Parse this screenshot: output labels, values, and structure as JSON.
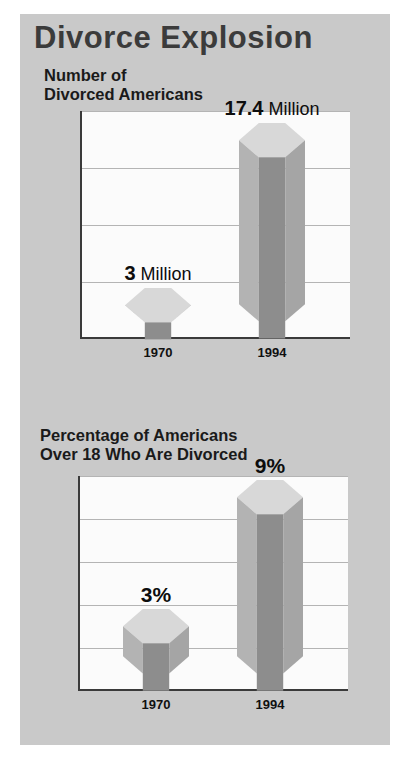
{
  "poster": {
    "title": "Divorce Explosion",
    "background_color": "#c9c9c9",
    "title_color": "#3b3b3b"
  },
  "chart_data": [
    {
      "type": "bar",
      "title": "Number of\nDivorced Americans",
      "title_line1": "Number of",
      "title_line2": "Divorced Americans",
      "categories": [
        "1970",
        "1994"
      ],
      "values": [
        3,
        17.4
      ],
      "value_labels": [
        "3",
        "17.4"
      ],
      "value_units": [
        "Million",
        "Million"
      ],
      "xlabel": "",
      "ylabel": "",
      "ylim": [
        0,
        20
      ],
      "yticks": [
        "0",
        "5",
        "10",
        "15",
        "20"
      ],
      "ytick_values": [
        0,
        5,
        10,
        15,
        20
      ],
      "grid": true,
      "legend": "none",
      "bar_style": "3d-hexagonal-prism",
      "colors": {
        "top_face": "#d8d8d8",
        "left_face": "#b3b3b3",
        "center_face": "#8d8d8d",
        "right_face": "#a5a5a5",
        "plot_background": "#fbfbfb",
        "gridline": "#b4b4b4",
        "axis": "#3a3a3a"
      }
    },
    {
      "type": "bar",
      "title": "Percentage of Americans\nOver 18 Who Are Divorced",
      "title_line1": "Percentage of Americans",
      "title_line2": "Over 18 Who Are Divorced",
      "categories": [
        "1970",
        "1994"
      ],
      "values": [
        3,
        9
      ],
      "value_labels": [
        "3%",
        "9%"
      ],
      "value_units": [
        "",
        ""
      ],
      "xlabel": "",
      "ylabel": "",
      "ylim": [
        0,
        10
      ],
      "yticks": [
        "0%",
        "2%",
        "4%",
        "6%",
        "8%",
        "10%"
      ],
      "ytick_values": [
        0,
        2,
        4,
        6,
        8,
        10
      ],
      "grid": true,
      "legend": "none",
      "bar_style": "3d-hexagonal-prism",
      "colors": {
        "top_face": "#d8d8d8",
        "left_face": "#b3b3b3",
        "center_face": "#8d8d8d",
        "right_face": "#a5a5a5",
        "plot_background": "#fbfbfb",
        "gridline": "#b4b4b4",
        "axis": "#3a3a3a"
      }
    }
  ]
}
